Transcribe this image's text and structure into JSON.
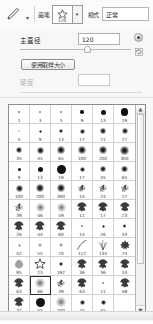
{
  "options_bar": {
    "tool_icon": "brush-tool-icon",
    "tool_caret": "▾",
    "brush_label": "画笔",
    "preset_thumb_icon": "star-brush-icon",
    "preset_size": "120",
    "preset_caret": "▾",
    "mode_label": "模式",
    "mode_value": "正常"
  },
  "panel": {
    "diameter_label": "主直径",
    "diameter_value": "120",
    "diameter_unit_button": "px-options-button",
    "diameter_reset_button": "reset-button",
    "use_sample_size_label": "使用取样大小",
    "hardness_label": "硬度",
    "hardness_value": "",
    "slider_position_percent": 58
  },
  "brush_grid": {
    "columns": 6,
    "selected_index": 55,
    "cells": [
      {
        "size": "1",
        "kind": "soft",
        "px": 1.5
      },
      {
        "size": "3",
        "kind": "soft",
        "px": 2
      },
      {
        "size": "5",
        "kind": "soft",
        "px": 2.5
      },
      {
        "size": "9",
        "kind": "hard",
        "px": 3.5
      },
      {
        "size": "13",
        "kind": "hard",
        "px": 5
      },
      {
        "size": "19",
        "kind": "hard",
        "px": 7.5
      },
      {
        "size": "5",
        "kind": "faint",
        "px": 2
      },
      {
        "size": "9",
        "kind": "soft",
        "px": 3
      },
      {
        "size": "13",
        "kind": "soft",
        "px": 4
      },
      {
        "size": "17",
        "kind": "soft",
        "px": 5
      },
      {
        "size": "21",
        "kind": "soft",
        "px": 5.5
      },
      {
        "size": "27",
        "kind": "soft",
        "px": 6
      },
      {
        "size": "35",
        "kind": "soft",
        "px": 6.5
      },
      {
        "size": "45",
        "kind": "soft",
        "px": 7
      },
      {
        "size": "65",
        "kind": "soft",
        "px": 7.5
      },
      {
        "size": "100",
        "kind": "soft",
        "px": 8
      },
      {
        "size": "200",
        "kind": "soft",
        "px": 8.5
      },
      {
        "size": "300",
        "kind": "soft",
        "px": 9
      },
      {
        "size": "9",
        "kind": "hard",
        "px": 3
      },
      {
        "size": "13",
        "kind": "hard",
        "px": 5
      },
      {
        "size": "19",
        "kind": "hard",
        "px": 9
      },
      {
        "size": "17",
        "kind": "soft",
        "px": 5
      },
      {
        "size": "45",
        "kind": "soft",
        "px": 6
      },
      {
        "size": "65",
        "kind": "soft",
        "px": 6.5
      },
      {
        "size": "100",
        "kind": "soft",
        "px": 7
      },
      {
        "size": "200",
        "kind": "soft",
        "px": 7.5
      },
      {
        "size": "300",
        "kind": "soft",
        "px": 8
      },
      {
        "size": "14",
        "kind": "texture",
        "px": 8
      },
      {
        "size": "24",
        "kind": "texture",
        "px": 9
      },
      {
        "size": "27",
        "kind": "texture",
        "px": 9
      },
      {
        "size": "39",
        "kind": "texture",
        "px": 10
      },
      {
        "size": "46",
        "kind": "faint",
        "px": 9
      },
      {
        "size": "59",
        "kind": "faint",
        "px": 9
      },
      {
        "size": "11",
        "kind": "leaf",
        "px": 5
      },
      {
        "size": "17",
        "kind": "leaf",
        "px": 8
      },
      {
        "size": "23",
        "kind": "leaf",
        "px": 9
      },
      {
        "size": "26",
        "kind": "leaf",
        "px": 10
      },
      {
        "size": "44",
        "kind": "leaf",
        "px": 10
      },
      {
        "size": "60",
        "kind": "leaf",
        "px": 10
      },
      {
        "size": "14",
        "kind": "soft",
        "px": 2.5
      },
      {
        "size": "26",
        "kind": "soft",
        "px": 3
      },
      {
        "size": "33",
        "kind": "soft",
        "px": 3.5
      },
      {
        "size": "42",
        "kind": "faint",
        "px": 3
      },
      {
        "size": "55",
        "kind": "faint",
        "px": 3.5
      },
      {
        "size": "70",
        "kind": "faint",
        "px": 4
      },
      {
        "size": "112",
        "kind": "stroke",
        "px": 10
      },
      {
        "size": "134",
        "kind": "grass",
        "px": 10
      },
      {
        "size": "74",
        "kind": "maple",
        "px": 10
      },
      {
        "size": "95",
        "kind": "blob",
        "px": 10
      },
      {
        "size": "23",
        "kind": "star",
        "px": 10
      },
      {
        "size": "192",
        "kind": "soft",
        "px": 4
      },
      {
        "size": "36",
        "kind": "leaf",
        "px": 9
      },
      {
        "size": "36",
        "kind": "leaf",
        "px": 9
      },
      {
        "size": "33",
        "kind": "leaf",
        "px": 9
      },
      {
        "size": "63",
        "kind": "leaf",
        "px": 10
      },
      {
        "size": "66",
        "kind": "faint",
        "px": 10
      },
      {
        "size": "39",
        "kind": "texture",
        "px": 9
      },
      {
        "size": "63",
        "kind": "leaf",
        "px": 9
      },
      {
        "size": "11",
        "kind": "soft",
        "px": 2.5
      },
      {
        "size": "48",
        "kind": "leaf",
        "px": 9
      },
      {
        "size": "32",
        "kind": "leaf",
        "px": 9
      },
      {
        "size": "55",
        "kind": "hard",
        "px": 9
      },
      {
        "size": "100",
        "kind": "faint",
        "px": 10
      },
      {
        "size": "75",
        "kind": "soft",
        "px": 5
      },
      {
        "size": "45",
        "kind": "soft",
        "px": 5
      },
      {
        "size": "",
        "kind": "empty",
        "px": 0
      }
    ]
  },
  "scrollbar": {
    "up_arrow": "▲",
    "down_arrow": "▼"
  }
}
